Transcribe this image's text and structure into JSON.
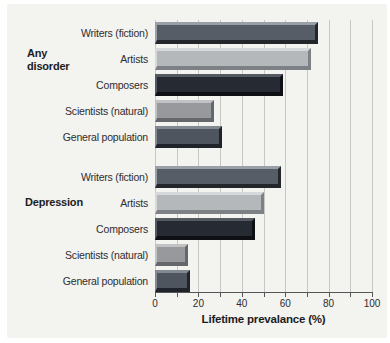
{
  "figure": {
    "background_color": "#f3f3ef",
    "gridline_color": "#c8c8c3",
    "axis_color": "#55565a",
    "text_color": "#2d2d2f"
  },
  "chart_data": {
    "type": "bar",
    "orientation": "horizontal",
    "xlabel": "Lifetime prevalance (%)",
    "xlim": [
      0,
      100
    ],
    "x_ticks": [
      0,
      20,
      40,
      60,
      80,
      100
    ],
    "gridline_step": 10,
    "grid": true,
    "groups": [
      {
        "group_label": "Any disorder",
        "bars": [
          {
            "label": "Writers (fiction)",
            "value": 75,
            "color": "#565d66",
            "color_light": "#9aa0a7",
            "color_dark": "#23272c"
          },
          {
            "label": "Artists",
            "value": 72,
            "color": "#b5b8ba",
            "color_light": "#d6d8d9",
            "color_dark": "#7d8084"
          },
          {
            "label": "Composers",
            "value": 59,
            "color": "#252a33",
            "color_light": "#555a62",
            "color_dark": "#0e1014"
          },
          {
            "label": "Scientists (natural)",
            "value": 27,
            "color": "#97999d",
            "color_light": "#c0c2c4",
            "color_dark": "#64676b"
          },
          {
            "label": "General population",
            "value": 31,
            "color": "#4e555e",
            "color_light": "#838991",
            "color_dark": "#1f242a"
          }
        ]
      },
      {
        "group_label": "Depression",
        "bars": [
          {
            "label": "Writers (fiction)",
            "value": 58,
            "color": "#565d66",
            "color_light": "#9aa0a7",
            "color_dark": "#23272c"
          },
          {
            "label": "Artists",
            "value": 50,
            "color": "#b5b8ba",
            "color_light": "#d6d8d9",
            "color_dark": "#7d8084"
          },
          {
            "label": "Composers",
            "value": 46,
            "color": "#252a33",
            "color_light": "#555a62",
            "color_dark": "#0e1014"
          },
          {
            "label": "Scientists (natural)",
            "value": 15,
            "color": "#97999d",
            "color_light": "#c0c2c4",
            "color_dark": "#64676b"
          },
          {
            "label": "General population",
            "value": 16,
            "color": "#4e555e",
            "color_light": "#838991",
            "color_dark": "#1f242a"
          }
        ]
      }
    ]
  }
}
